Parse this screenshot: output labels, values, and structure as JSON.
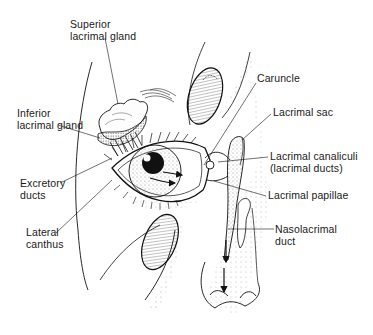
{
  "figure": {
    "labels": {
      "superior_gland": [
        "Superior",
        "lacrimal gland"
      ],
      "inferior_gland": [
        "Inferior",
        "lacrimal gland"
      ],
      "excretory_ducts": [
        "Excretory",
        "ducts"
      ],
      "lateral_canthus": [
        "Lateral",
        "canthus"
      ],
      "caruncle": [
        "Caruncle"
      ],
      "lacrimal_sac": [
        "Lacrimal sac"
      ],
      "canaliculi": [
        "Lacrimal canaliculi",
        "(lacrimal ducts)"
      ],
      "papillae": [
        "Lacrimal papillae"
      ],
      "nasolacrimal_duct": [
        "Nasolacrimal",
        "duct"
      ]
    }
  }
}
